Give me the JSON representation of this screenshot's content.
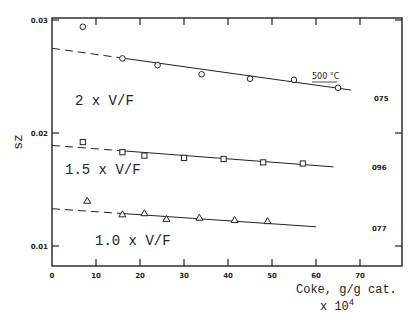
{
  "chart_data": {
    "type": "scatter",
    "title": "",
    "annotation": "500 °C",
    "xlabel": "Coke, g/g cat.",
    "xlabel_multiplier": "x 10",
    "xlabel_exponent": "4",
    "ylabel": "sz",
    "xlim": [
      0,
      80
    ],
    "ylim": [
      0.008,
      0.03
    ],
    "x_ticks": [
      0,
      10,
      20,
      30,
      40,
      50,
      60,
      70
    ],
    "x_tick_labels": [
      "0",
      "10",
      "20",
      "30",
      "40",
      "50",
      "60",
      "70"
    ],
    "y_ticks": [
      0.01,
      0.02,
      0.03
    ],
    "y_tick_labels": [
      "0.01",
      "0.02",
      "0.03"
    ],
    "grid": false,
    "series": [
      {
        "name": "2 x V/F",
        "id": "075",
        "marker": "circle",
        "x": [
          7,
          16,
          24,
          34,
          45,
          55,
          65
        ],
        "y": [
          0.0294,
          0.0266,
          0.026,
          0.0252,
          0.0248,
          0.0247,
          0.024
        ],
        "fit": {
          "x0": 0,
          "y0": 0.0275,
          "x1": 68,
          "y1": 0.0238,
          "dashed_until": 15
        }
      },
      {
        "name": "1.5 x V/F",
        "id": "096",
        "marker": "square",
        "x": [
          7,
          16,
          21,
          30,
          39,
          48,
          57
        ],
        "y": [
          0.0192,
          0.0183,
          0.018,
          0.0178,
          0.0177,
          0.0174,
          0.0173
        ],
        "fit": {
          "x0": 0,
          "y0": 0.0189,
          "x1": 64,
          "y1": 0.017,
          "dashed_until": 15
        }
      },
      {
        "name": "1.0 x V/F",
        "id": "077",
        "marker": "triangle",
        "x": [
          8,
          16,
          21,
          26,
          33.5,
          41.5,
          49
        ],
        "y": [
          0.014,
          0.0128,
          0.0129,
          0.0124,
          0.0125,
          0.0123,
          0.0122
        ],
        "fit": {
          "x0": 0,
          "y0": 0.0133,
          "x1": 60,
          "y1": 0.0117,
          "dashed_until": 15
        }
      }
    ]
  }
}
